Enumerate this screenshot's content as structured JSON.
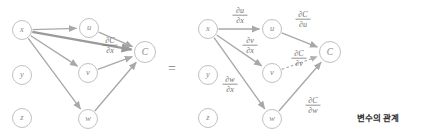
{
  "canvas": {
    "width": 421,
    "height": 136,
    "background": "#ffffff"
  },
  "colors": {
    "node_stroke": "#b9b9b9",
    "node_fill": "#ffffff",
    "node_text": "#8a8a8a",
    "edge": "#a8a8a8",
    "edge_thick": "#9a9a9a",
    "edge_dashed": "#b0b0b0",
    "formula_text": "#6f6f6f",
    "caption_text": "#2b2b2b",
    "equals_text": "#7d7d7d"
  },
  "equals": {
    "symbol": "=",
    "x": 172,
    "y": 70
  },
  "caption": {
    "text": "변수의 관계",
    "x": 378,
    "y": 118
  },
  "left_graph": {
    "name": "total-derivative-graph",
    "nodes": [
      {
        "id": "x",
        "label": "x",
        "cx": 22,
        "cy": 30,
        "r": 9.5
      },
      {
        "id": "y",
        "label": "y",
        "cx": 22,
        "cy": 75,
        "r": 9.5
      },
      {
        "id": "z",
        "label": "z",
        "cx": 22,
        "cy": 118,
        "r": 9.5
      },
      {
        "id": "u",
        "label": "u",
        "cx": 89,
        "cy": 28,
        "r": 9.5
      },
      {
        "id": "v",
        "label": "v",
        "cx": 88,
        "cy": 73,
        "r": 9.5
      },
      {
        "id": "w",
        "label": "w",
        "cx": 88,
        "cy": 119,
        "r": 9.5
      },
      {
        "id": "C",
        "label": "C",
        "cx": 145,
        "cy": 52,
        "r": 10.5
      }
    ],
    "edges": [
      {
        "id": "x-to-u",
        "from": "x",
        "to": "u",
        "style": "solid"
      },
      {
        "id": "x-to-v",
        "from": "x",
        "to": "v",
        "style": "solid"
      },
      {
        "id": "x-to-w",
        "from": "x",
        "to": "w",
        "style": "solid"
      },
      {
        "id": "x-to-C",
        "from": "x",
        "to": "C",
        "style": "thick"
      },
      {
        "id": "u-to-C",
        "from": "u",
        "to": "C",
        "style": "solid"
      },
      {
        "id": "v-to-C",
        "from": "v",
        "to": "C",
        "style": "solid"
      },
      {
        "id": "w-to-C",
        "from": "w",
        "to": "C",
        "style": "solid"
      }
    ],
    "labels": [
      {
        "id": "dC-dx",
        "numerator": "∂C",
        "denominator": "∂x",
        "x": 110,
        "y": 44
      }
    ]
  },
  "right_graph": {
    "name": "chain-rule-graph",
    "nodes": [
      {
        "id": "x",
        "label": "x",
        "cx": 208,
        "cy": 29,
        "r": 9.5
      },
      {
        "id": "y",
        "label": "y",
        "cx": 208,
        "cy": 75,
        "r": 9.5
      },
      {
        "id": "z",
        "label": "z",
        "cx": 208,
        "cy": 118,
        "r": 9.5
      },
      {
        "id": "u",
        "label": "u",
        "cx": 272,
        "cy": 29,
        "r": 9.5
      },
      {
        "id": "v",
        "label": "v",
        "cx": 272,
        "cy": 73,
        "r": 9.5
      },
      {
        "id": "w",
        "label": "w",
        "cx": 272,
        "cy": 119,
        "r": 9.5
      },
      {
        "id": "C",
        "label": "C",
        "cx": 330,
        "cy": 52,
        "r": 10.5
      }
    ],
    "edges": [
      {
        "id": "x-to-u",
        "from": "x",
        "to": "u",
        "style": "solid"
      },
      {
        "id": "x-to-v",
        "from": "x",
        "to": "v",
        "style": "solid"
      },
      {
        "id": "x-to-w",
        "from": "x",
        "to": "w",
        "style": "solid"
      },
      {
        "id": "u-to-C",
        "from": "u",
        "to": "C",
        "style": "solid"
      },
      {
        "id": "v-to-C",
        "from": "v",
        "to": "C",
        "style": "dashed"
      },
      {
        "id": "w-to-C",
        "from": "w",
        "to": "C",
        "style": "solid"
      }
    ],
    "labels": [
      {
        "id": "du-dx",
        "numerator": "∂u",
        "denominator": "∂x",
        "x": 240,
        "y": 14
      },
      {
        "id": "dv-dx",
        "numerator": "∂v",
        "denominator": "∂x",
        "x": 250,
        "y": 44
      },
      {
        "id": "dw-dx",
        "numerator": "∂w",
        "denominator": "∂x",
        "x": 230,
        "y": 83
      },
      {
        "id": "dC-du",
        "numerator": "∂C",
        "denominator": "∂u",
        "x": 303,
        "y": 18
      },
      {
        "id": "dC-dv",
        "numerator": "∂C",
        "denominator": "∂v",
        "x": 299,
        "y": 57
      },
      {
        "id": "dC-dw",
        "numerator": "∂C",
        "denominator": "∂w",
        "x": 313,
        "y": 104
      }
    ]
  }
}
